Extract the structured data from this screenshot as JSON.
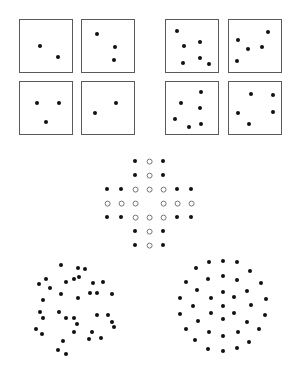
{
  "figure": {
    "colors": {
      "dot": "#111111",
      "ring": "#777777",
      "panel_border": "#5a5a5a",
      "background": "#ffffff"
    }
  },
  "panel_groups": [
    {
      "name": "left-panels",
      "panels": [
        {
          "x": 19,
          "y": 19,
          "size": 54,
          "dots": [
            [
              40,
              46
            ],
            [
              58,
              57
            ]
          ]
        },
        {
          "x": 81,
          "y": 19,
          "size": 54,
          "dots": [
            [
              97,
              34
            ],
            [
              115,
              47
            ],
            [
              114,
              60
            ]
          ]
        },
        {
          "x": 19,
          "y": 81,
          "size": 54,
          "dots": [
            [
              37,
              103
            ],
            [
              59,
              103
            ],
            [
              46,
              122
            ]
          ]
        },
        {
          "x": 81,
          "y": 81,
          "size": 54,
          "dots": [
            [
              95,
              113
            ],
            [
              116,
              103
            ]
          ]
        }
      ]
    },
    {
      "name": "right-panels",
      "panels": [
        {
          "x": 165,
          "y": 19,
          "size": 54,
          "dots": [
            [
              177,
              31
            ],
            [
              184,
              46
            ],
            [
              200,
              42
            ],
            [
              183,
              63
            ],
            [
              200,
              58
            ],
            [
              209,
              64
            ]
          ]
        },
        {
          "x": 228,
          "y": 19,
          "size": 54,
          "dots": [
            [
              238,
              40
            ],
            [
              268,
              32
            ],
            [
              248,
              49
            ],
            [
              262,
              47
            ],
            [
              237,
              61
            ]
          ]
        },
        {
          "x": 165,
          "y": 81,
          "size": 54,
          "dots": [
            [
              201,
              92
            ],
            [
              181,
              103
            ],
            [
              200,
              108
            ],
            [
              175,
              119
            ],
            [
              189,
              127
            ],
            [
              201,
              124
            ]
          ]
        },
        {
          "x": 228,
          "y": 81,
          "size": 54,
          "dots": [
            [
              251,
              94
            ],
            [
              273,
              95
            ],
            [
              238,
              113
            ],
            [
              273,
              112
            ],
            [
              249,
              124
            ]
          ]
        }
      ]
    }
  ],
  "cross_lattice": {
    "origin_x": 107,
    "origin_y": 161,
    "step": 14,
    "rows": [
      "..FOF..",
      "..FOF..",
      "FFOOOFF",
      "OOO.OOO",
      "FFOOOFF",
      "..FOF..",
      "..FOF.."
    ],
    "legend": {
      "F": "filled dot",
      "O": "open ring",
      ".": "empty"
    }
  },
  "circle_fields": [
    {
      "name": "random-circle",
      "dots": [
        [
          61,
          265
        ],
        [
          78,
          268
        ],
        [
          85,
          269
        ],
        [
          46,
          279
        ],
        [
          39,
          284
        ],
        [
          50,
          288
        ],
        [
          66,
          282
        ],
        [
          74,
          279
        ],
        [
          79,
          277
        ],
        [
          93,
          283
        ],
        [
          103,
          282
        ],
        [
          61,
          294
        ],
        [
          90,
          293
        ],
        [
          97,
          293
        ],
        [
          112,
          294
        ],
        [
          43,
          300
        ],
        [
          78,
          298
        ],
        [
          40,
          312
        ],
        [
          59,
          312
        ],
        [
          43,
          318
        ],
        [
          66,
          318
        ],
        [
          74,
          318
        ],
        [
          77,
          324
        ],
        [
          97,
          315
        ],
        [
          108,
          315
        ],
        [
          112,
          322
        ],
        [
          114,
          327
        ],
        [
          36,
          329
        ],
        [
          42,
          334
        ],
        [
          63,
          341
        ],
        [
          74,
          332
        ],
        [
          92,
          332
        ],
        [
          89,
          339
        ],
        [
          101,
          338
        ],
        [
          58,
          350
        ],
        [
          66,
          354
        ]
      ]
    },
    {
      "name": "regular-circle",
      "dots": [
        [
          209,
          262
        ],
        [
          223,
          261
        ],
        [
          237,
          262
        ],
        [
          196,
          268
        ],
        [
          250,
          271
        ],
        [
          186,
          282
        ],
        [
          208,
          279
        ],
        [
          223,
          276
        ],
        [
          237,
          280
        ],
        [
          261,
          283
        ],
        [
          197,
          290
        ],
        [
          223,
          292
        ],
        [
          247,
          291
        ],
        [
          180,
          298
        ],
        [
          211,
          298
        ],
        [
          234,
          297
        ],
        [
          266,
          299
        ],
        [
          193,
          306
        ],
        [
          223,
          306
        ],
        [
          251,
          305
        ],
        [
          180,
          314
        ],
        [
          211,
          313
        ],
        [
          234,
          313
        ],
        [
          265,
          315
        ],
        [
          198,
          321
        ],
        [
          223,
          319
        ],
        [
          247,
          322
        ],
        [
          186,
          329
        ],
        [
          209,
          332
        ],
        [
          223,
          336
        ],
        [
          238,
          332
        ],
        [
          259,
          329
        ],
        [
          195,
          340
        ],
        [
          249,
          342
        ],
        [
          208,
          349
        ],
        [
          223,
          351
        ],
        [
          237,
          348
        ]
      ]
    }
  ]
}
